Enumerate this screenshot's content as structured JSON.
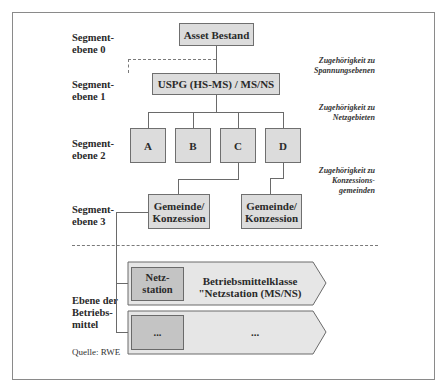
{
  "diagram": {
    "levels": [
      {
        "label": "Segment-\nebene 0",
        "line1": "Segment-",
        "line2": "ebene 0"
      },
      {
        "label": "Segment-\nebene 1",
        "line1": "Segment-",
        "line2": "ebene 1"
      },
      {
        "label": "Segment-\nebene 2",
        "line1": "Segment-",
        "line2": "ebene 2"
      },
      {
        "label": "Segment-\nebene 3",
        "line1": "Segment-",
        "line2": "ebene 3"
      },
      {
        "label": "Ebene der Betriebs-mittel",
        "line1": "Ebene der",
        "line2": "Betriebs-",
        "line3": "mittel"
      }
    ],
    "nodes": {
      "root": "Asset Bestand",
      "level1": "USPG (HS-MS) / MS/NS",
      "level2": [
        "A",
        "B",
        "C",
        "D"
      ],
      "level3": [
        {
          "line1": "Gemeinde/",
          "line2": "Konzession"
        },
        {
          "line1": "Gemeinde/",
          "line2": "Konzession"
        }
      ]
    },
    "notes": [
      {
        "line1": "Zugehörigkeit zu",
        "line2": "Spannungsebenen"
      },
      {
        "line1": "Zugehörigkeit zu",
        "line2": "Netzgebieten"
      },
      {
        "line1": "Zugehörigkeit zu",
        "line2": "Konzessions-",
        "line3": "gemeinden"
      }
    ],
    "asset_classes": [
      {
        "box_line1": "Netz-",
        "box_line2": "station",
        "title_line1": "Betriebsmittelklasse",
        "title_line2": "\"Netzstation (MS/NS)"
      },
      {
        "box_line1": "...",
        "box_line2": "",
        "title_line1": "...",
        "title_line2": ""
      }
    ],
    "source": "Quelle: RWE",
    "colors": {
      "box_fill": "#dcdcdc",
      "inner_box_fill": "#c4c4c4",
      "arrow_fill": "#e6e6e6",
      "line": "#6a6a6a",
      "frame": "#8a8a8a"
    }
  }
}
